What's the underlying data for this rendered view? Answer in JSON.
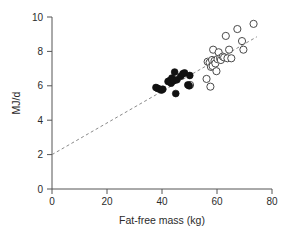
{
  "chart_data": {
    "type": "scatter",
    "title": "",
    "xlabel": "Fat-free mass (kg)",
    "ylabel": "MJ/d",
    "xlim": [
      0,
      80
    ],
    "ylim": [
      0,
      10
    ],
    "xticks": [
      0,
      20,
      40,
      60,
      80
    ],
    "yticks": [
      0,
      2,
      4,
      6,
      8,
      10
    ],
    "xtick_labels": [
      "0",
      "20",
      "40",
      "60",
      "80"
    ],
    "ytick_labels": [
      "0",
      "2",
      "4",
      "6",
      "8",
      "10"
    ],
    "grid": false,
    "legend": "none",
    "series": [
      {
        "name": "filled-circles",
        "marker": "filled-circle",
        "color": "#111111",
        "points": [
          [
            37.8,
            5.9
          ],
          [
            38.4,
            5.85
          ],
          [
            39.2,
            5.8
          ],
          [
            39.8,
            5.75
          ],
          [
            40.3,
            5.8
          ],
          [
            42.2,
            6.25
          ],
          [
            42.8,
            6.3
          ],
          [
            43.3,
            6.15
          ],
          [
            43.6,
            6.45
          ],
          [
            44.3,
            6.3
          ],
          [
            44.6,
            6.8
          ],
          [
            45.0,
            5.55
          ],
          [
            45.4,
            6.35
          ],
          [
            46.8,
            6.55
          ],
          [
            47.6,
            6.7
          ],
          [
            48.2,
            6.75
          ],
          [
            49.4,
            6.05
          ],
          [
            49.9,
            6.0
          ],
          [
            50.1,
            6.6
          ]
        ]
      },
      {
        "name": "open-circles",
        "marker": "open-circle",
        "color": "#ffffff",
        "points": [
          [
            50.2,
            6.05
          ],
          [
            56.2,
            6.4
          ],
          [
            56.6,
            7.4
          ],
          [
            57.3,
            7.35
          ],
          [
            57.6,
            5.95
          ],
          [
            57.8,
            7.1
          ],
          [
            58.2,
            7.5
          ],
          [
            58.4,
            7.15
          ],
          [
            58.6,
            8.1
          ],
          [
            59.1,
            7.45
          ],
          [
            59.4,
            7.3
          ],
          [
            59.8,
            6.85
          ],
          [
            60.2,
            7.55
          ],
          [
            60.6,
            7.95
          ],
          [
            61.1,
            7.6
          ],
          [
            61.4,
            7.5
          ],
          [
            62.1,
            7.7
          ],
          [
            62.6,
            7.65
          ],
          [
            63.2,
            8.9
          ],
          [
            63.8,
            7.6
          ],
          [
            64.4,
            8.1
          ],
          [
            65.2,
            7.6
          ],
          [
            67.4,
            9.3
          ],
          [
            69.1,
            8.6
          ],
          [
            69.6,
            8.1
          ],
          [
            73.3,
            9.6
          ]
        ]
      }
    ],
    "regression_line": {
      "style": "dashed",
      "color": "#8a8a8a",
      "x_start": 0,
      "y_start": 2.0,
      "x_end": 74.5,
      "y_end": 8.85
    }
  },
  "axes": {
    "x_title": "Fat-free mass (kg)",
    "y_title": "MJ/d"
  }
}
